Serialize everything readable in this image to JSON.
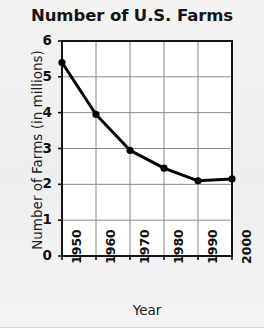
{
  "chart_data": {
    "type": "line",
    "title": "Number of U.S. Farms",
    "xlabel": "Year",
    "ylabel": "Number of Farms (in millions)",
    "x": [
      1950,
      1960,
      1970,
      1980,
      1990,
      2000
    ],
    "categories": [
      "1950",
      "1960",
      "1970",
      "1980",
      "1990",
      "2000"
    ],
    "values": [
      5.4,
      3.95,
      2.95,
      2.45,
      2.1,
      2.15
    ],
    "series": [
      {
        "name": "Number of Farms (in millions)",
        "values": [
          5.4,
          3.95,
          2.95,
          2.45,
          2.1,
          2.15
        ]
      }
    ],
    "xlim": [
      1950,
      2000
    ],
    "ylim": [
      0,
      6
    ],
    "ytick_labels": [
      "0",
      "1",
      "2",
      "3",
      "4",
      "5",
      "6"
    ],
    "ytick_values": [
      0,
      1,
      2,
      3,
      4,
      5,
      6
    ],
    "xtick_labels": [
      "1950",
      "1960",
      "1970",
      "1980",
      "1990",
      "2000"
    ],
    "grid": true,
    "legend": false,
    "marker": "filled-circle",
    "line_color": "#000000",
    "marker_color": "#000000",
    "grid_color": "#8a8a8a",
    "axis_color": "#141414",
    "plot_background": "#ffffff",
    "figure_background": "#f1f1f1"
  },
  "figure": {
    "title": "Number of U.S. Farms",
    "x_axis_title": "Year",
    "y_axis_title": "Number of Farms (in millions)"
  }
}
